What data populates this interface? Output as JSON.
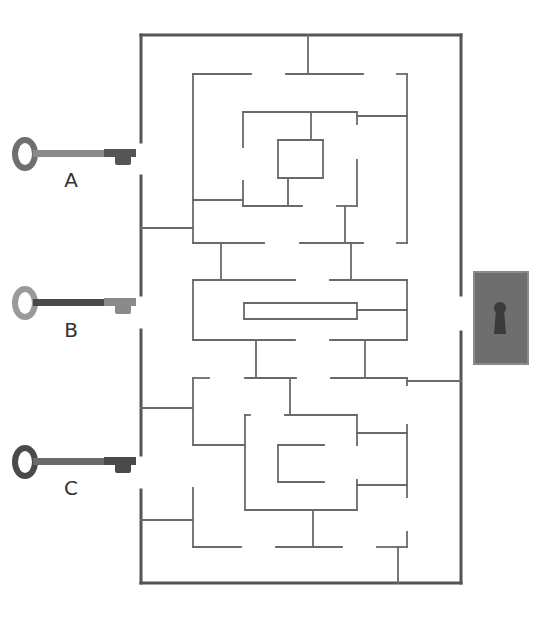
{
  "puzzle": {
    "type": "maze",
    "colors": {
      "outer_wall": "#555555",
      "inner_wall": "#6a6a6a",
      "key_a_body": "#6f6f6f",
      "key_a_shaft": "#8a8a8a",
      "key_b_body": "#9a9a9a",
      "key_b_shaft": "#4a4a4a",
      "key_c_body": "#4a4a4a",
      "key_c_shaft": "#6a6a6a",
      "lock_plate": "#6e6e6e",
      "lock_border": "#8a8a8a",
      "keyhole": "#3a3a3a",
      "label": "#333333"
    },
    "keys": [
      {
        "id": "A",
        "label": "A",
        "y": 154,
        "label_y": 168
      },
      {
        "id": "B",
        "label": "B",
        "y": 303,
        "label_y": 318
      },
      {
        "id": "C",
        "label": "C",
        "y": 462,
        "label_y": 476
      }
    ],
    "lock": {
      "name": "keyhole-lock",
      "x": 474,
      "y": 272,
      "w": 54,
      "h": 92
    },
    "outer_walls": [
      [
        141,
        35,
        461,
        35
      ],
      [
        141,
        35,
        141,
        142
      ],
      [
        141,
        176,
        141,
        295
      ],
      [
        141,
        330,
        141,
        455
      ],
      [
        141,
        490,
        141,
        583
      ],
      [
        141,
        583,
        461,
        583
      ],
      [
        461,
        35,
        461,
        295
      ],
      [
        461,
        332,
        461,
        583
      ]
    ],
    "inner_walls": [
      [
        308,
        35,
        308,
        74
      ],
      [
        193,
        74,
        251,
        74
      ],
      [
        286,
        74,
        363,
        74
      ],
      [
        397,
        74,
        407,
        74
      ],
      [
        193,
        74,
        193,
        243
      ],
      [
        407,
        74,
        407,
        243
      ],
      [
        243,
        112,
        357,
        112
      ],
      [
        357,
        112,
        357,
        124
      ],
      [
        357,
        116,
        407,
        116
      ],
      [
        243,
        112,
        243,
        147
      ],
      [
        311,
        112,
        311,
        140
      ],
      [
        278,
        140,
        323,
        140
      ],
      [
        323,
        140,
        323,
        178
      ],
      [
        323,
        178,
        278,
        178
      ],
      [
        278,
        178,
        278,
        140
      ],
      [
        357,
        160,
        357,
        206
      ],
      [
        337,
        206,
        357,
        206
      ],
      [
        243,
        181,
        243,
        206
      ],
      [
        243,
        206,
        302,
        206
      ],
      [
        288,
        178,
        288,
        206
      ],
      [
        193,
        200,
        243,
        200
      ],
      [
        141,
        228,
        193,
        228
      ],
      [
        193,
        243,
        264,
        243
      ],
      [
        300,
        243,
        363,
        243
      ],
      [
        397,
        243,
        407,
        243
      ],
      [
        345,
        206,
        345,
        243
      ],
      [
        221,
        243,
        221,
        280
      ],
      [
        351,
        243,
        351,
        280
      ],
      [
        193,
        280,
        295,
        280
      ],
      [
        330,
        280,
        407,
        280
      ],
      [
        407,
        280,
        407,
        340
      ],
      [
        193,
        280,
        193,
        340
      ],
      [
        244,
        303,
        357,
        303
      ],
      [
        357,
        303,
        357,
        319
      ],
      [
        357,
        319,
        244,
        319
      ],
      [
        244,
        319,
        244,
        303
      ],
      [
        357,
        310,
        407,
        310
      ],
      [
        193,
        340,
        295,
        340
      ],
      [
        330,
        340,
        407,
        340
      ],
      [
        256,
        340,
        256,
        378
      ],
      [
        365,
        340,
        365,
        378
      ],
      [
        193,
        378,
        209,
        378
      ],
      [
        245,
        378,
        296,
        378
      ],
      [
        331,
        378,
        407,
        378
      ],
      [
        290,
        378,
        290,
        415
      ],
      [
        407,
        378,
        407,
        385
      ],
      [
        407,
        381,
        461,
        381
      ],
      [
        193,
        378,
        193,
        445
      ],
      [
        141,
        408,
        193,
        408
      ],
      [
        245,
        415,
        250,
        415
      ],
      [
        285,
        415,
        357,
        415
      ],
      [
        245,
        415,
        245,
        510
      ],
      [
        357,
        415,
        357,
        445
      ],
      [
        357,
        433,
        407,
        433
      ],
      [
        407,
        425,
        407,
        497
      ],
      [
        193,
        445,
        245,
        445
      ],
      [
        278,
        445,
        324,
        445
      ],
      [
        278,
        445,
        278,
        482
      ],
      [
        278,
        482,
        324,
        482
      ],
      [
        357,
        480,
        357,
        510
      ],
      [
        357,
        485,
        407,
        485
      ],
      [
        245,
        510,
        357,
        510
      ],
      [
        313,
        510,
        313,
        547
      ],
      [
        141,
        520,
        193,
        520
      ],
      [
        193,
        488,
        193,
        547
      ],
      [
        193,
        547,
        241,
        547
      ],
      [
        276,
        547,
        342,
        547
      ],
      [
        377,
        547,
        407,
        547
      ],
      [
        407,
        532,
        407,
        547
      ],
      [
        398,
        547,
        398,
        583
      ]
    ]
  }
}
